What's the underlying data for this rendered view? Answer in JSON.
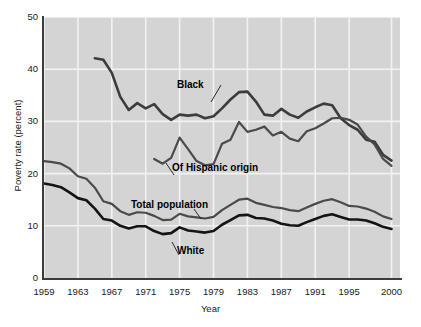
{
  "chart_data": {
    "type": "line",
    "title": "",
    "xlabel": "Year",
    "ylabel": "Poverty rate (percent)",
    "xlim": [
      1959,
      2001
    ],
    "ylim": [
      0,
      50
    ],
    "yticks": [
      0,
      10,
      20,
      30,
      40,
      50
    ],
    "ytick_labels": [
      "0",
      "10",
      "20",
      "30",
      "40",
      "50"
    ],
    "xticks": [
      1959,
      1963,
      1967,
      1971,
      1975,
      1979,
      1983,
      1987,
      1991,
      1995,
      2000
    ],
    "xtick_labels": [
      "1959",
      "1963",
      "1967",
      "1971",
      "1975",
      "1979",
      "1983",
      "1987",
      "1991",
      "1995",
      "2000"
    ],
    "grid": "horizontal-and-vertical-white-gridlines",
    "plot_background": "#d4d4d4",
    "legend_position": "inline-annotations",
    "series": [
      {
        "name": "Black",
        "label": "Black",
        "color": "#3c3c3c",
        "x": [
          1965,
          1966,
          1967,
          1968,
          1969,
          1970,
          1971,
          1972,
          1973,
          1974,
          1975,
          1976,
          1977,
          1978,
          1979,
          1980,
          1981,
          1982,
          1983,
          1984,
          1985,
          1986,
          1987,
          1988,
          1989,
          1990,
          1991,
          1992,
          1993,
          1994,
          1995,
          1996,
          1997,
          1998,
          1999,
          2000
        ],
        "y": [
          42.1,
          41.8,
          39.3,
          34.7,
          32.2,
          33.5,
          32.5,
          33.3,
          31.4,
          30.3,
          31.3,
          31.1,
          31.3,
          30.6,
          31.0,
          32.5,
          34.2,
          35.6,
          35.7,
          33.8,
          31.3,
          31.1,
          32.4,
          31.3,
          30.7,
          31.9,
          32.7,
          33.4,
          33.1,
          30.6,
          29.3,
          28.4,
          26.5,
          26.1,
          23.6,
          22.5
        ]
      },
      {
        "name": "Of Hispanic origin",
        "label": "Of Hispanic origin",
        "color": "#4a4a4a",
        "x": [
          1972,
          1973,
          1974,
          1975,
          1976,
          1977,
          1978,
          1979,
          1980,
          1981,
          1982,
          1983,
          1984,
          1985,
          1986,
          1987,
          1988,
          1989,
          1990,
          1991,
          1992,
          1993,
          1994,
          1995,
          1996,
          1997,
          1998,
          1999,
          2000
        ],
        "y": [
          22.8,
          21.9,
          23.0,
          26.9,
          24.7,
          22.4,
          21.6,
          21.8,
          25.7,
          26.5,
          29.9,
          28.0,
          28.4,
          29.0,
          27.3,
          28.0,
          26.7,
          26.2,
          28.1,
          28.7,
          29.6,
          30.6,
          30.7,
          30.3,
          29.4,
          27.1,
          25.6,
          22.8,
          21.5
        ]
      },
      {
        "name": "Total population",
        "label": "Total population",
        "color": "#4a4a4a",
        "x": [
          1959,
          1960,
          1961,
          1962,
          1963,
          1964,
          1965,
          1966,
          1967,
          1968,
          1969,
          1970,
          1971,
          1972,
          1973,
          1974,
          1975,
          1976,
          1977,
          1978,
          1979,
          1980,
          1981,
          1982,
          1983,
          1984,
          1985,
          1986,
          1987,
          1988,
          1989,
          1990,
          1991,
          1992,
          1993,
          1994,
          1995,
          1996,
          1997,
          1998,
          1999,
          2000
        ],
        "y": [
          22.4,
          22.2,
          21.9,
          21.0,
          19.5,
          19.0,
          17.3,
          14.7,
          14.2,
          12.8,
          12.1,
          12.6,
          12.5,
          11.9,
          11.1,
          11.2,
          12.3,
          11.8,
          11.6,
          11.4,
          11.7,
          13.0,
          14.0,
          15.0,
          15.2,
          14.4,
          14.0,
          13.6,
          13.4,
          13.0,
          12.8,
          13.5,
          14.2,
          14.8,
          15.1,
          14.5,
          13.8,
          13.7,
          13.3,
          12.7,
          11.8,
          11.3
        ]
      },
      {
        "name": "White",
        "label": "White",
        "color": "#141414",
        "x": [
          1959,
          1960,
          1961,
          1962,
          1963,
          1964,
          1965,
          1966,
          1967,
          1968,
          1969,
          1970,
          1971,
          1972,
          1973,
          1974,
          1975,
          1976,
          1977,
          1978,
          1979,
          1980,
          1981,
          1982,
          1983,
          1984,
          1985,
          1986,
          1987,
          1988,
          1989,
          1990,
          1991,
          1992,
          1993,
          1994,
          1995,
          1996,
          1997,
          1998,
          1999,
          2000
        ],
        "y": [
          18.1,
          17.8,
          17.4,
          16.4,
          15.3,
          14.9,
          13.3,
          11.3,
          11.0,
          10.0,
          9.5,
          9.9,
          9.9,
          9.0,
          8.4,
          8.6,
          9.7,
          9.1,
          8.9,
          8.7,
          9.0,
          10.2,
          11.1,
          12.0,
          12.1,
          11.5,
          11.4,
          11.0,
          10.4,
          10.1,
          10.0,
          10.7,
          11.3,
          11.9,
          12.2,
          11.7,
          11.2,
          11.2,
          11.0,
          10.5,
          9.8,
          9.4
        ]
      }
    ],
    "annotations": [
      {
        "text": "Black",
        "series": "Black"
      },
      {
        "text": "Of Hispanic origin",
        "series": "Of Hispanic origin"
      },
      {
        "text": "Total population",
        "series": "Total population"
      },
      {
        "text": "White",
        "series": "White"
      }
    ]
  }
}
